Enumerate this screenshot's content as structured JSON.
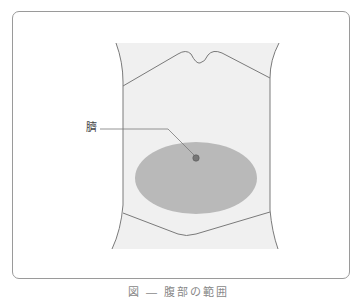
{
  "figure": {
    "label": "臍",
    "caption": "図 ― 腹部の範囲",
    "colors": {
      "frame": "#9a9a9a",
      "torso_fill": "#f0f0f0",
      "outline": "#7a7a7a",
      "region_fill": "#b9b9b9",
      "navel_dot": "#777777"
    },
    "region": {
      "shape": "ellipse",
      "cx": 196,
      "cy": 178,
      "rx": 61,
      "ry": 36
    },
    "navel": {
      "x": 196,
      "y": 158
    }
  }
}
